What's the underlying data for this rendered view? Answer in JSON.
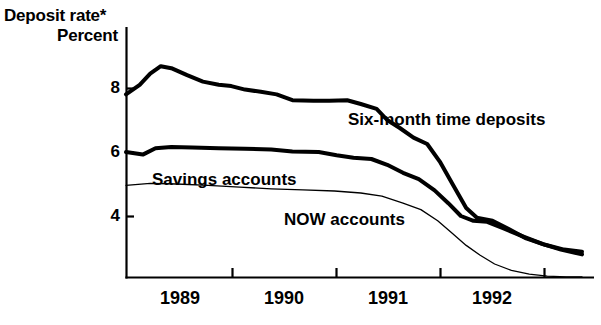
{
  "title": {
    "line1": "Deposit rate*",
    "line2": "Percent"
  },
  "axes": {
    "y_ticks": [
      "8",
      "6",
      "4"
    ],
    "x_ticks": [
      "1989",
      "1990",
      "1991",
      "1992"
    ]
  },
  "series_labels": {
    "six_month": "Six-month time deposits",
    "savings": "Savings accounts",
    "now": "NOW accounts"
  },
  "chart_data": {
    "type": "line",
    "title": "Deposit rate*",
    "subtitle": "Percent",
    "xlabel": "",
    "ylabel": "Percent",
    "xlim": [
      1988.62,
      1992.95
    ],
    "ylim": [
      2.06,
      9.9
    ],
    "yticks": [
      4,
      6,
      8
    ],
    "xticks": [
      1989,
      1990,
      1991,
      1992
    ],
    "grid": false,
    "legend": "inline-annotations",
    "annotations": [
      {
        "text": "Six-month time deposits",
        "x": 1991.0,
        "y": 6.85
      },
      {
        "text": "Savings accounts",
        "x": 1989.2,
        "y": 5.0
      },
      {
        "text": "NOW accounts",
        "x": 1990.3,
        "y": 3.8
      }
    ],
    "series": [
      {
        "name": "Six-month time deposits",
        "style": "thick",
        "x": [
          1988.62,
          1988.75,
          1988.85,
          1988.95,
          1989.05,
          1989.2,
          1989.35,
          1989.5,
          1989.62,
          1989.75,
          1989.9,
          1990.05,
          1990.2,
          1990.4,
          1990.55,
          1990.72,
          1990.85,
          1991.0,
          1991.1,
          1991.22,
          1991.35,
          1991.48,
          1991.6,
          1991.72,
          1991.85,
          1991.95,
          1992.1,
          1992.25,
          1992.42,
          1992.6,
          1992.78,
          1992.95
        ],
        "y": [
          7.8,
          8.1,
          8.45,
          8.68,
          8.62,
          8.4,
          8.2,
          8.1,
          8.06,
          7.95,
          7.88,
          7.8,
          7.62,
          7.6,
          7.6,
          7.62,
          7.5,
          7.35,
          7.0,
          6.75,
          6.45,
          6.25,
          5.7,
          5.0,
          4.25,
          3.95,
          3.85,
          3.6,
          3.3,
          3.1,
          2.95,
          2.88
        ]
      },
      {
        "name": "Savings accounts",
        "style": "thick",
        "x": [
          1988.62,
          1988.78,
          1988.9,
          1989.05,
          1989.25,
          1989.5,
          1989.75,
          1990.0,
          1990.2,
          1990.45,
          1990.62,
          1990.78,
          1990.95,
          1991.1,
          1991.25,
          1991.4,
          1991.55,
          1991.68,
          1991.8,
          1991.92,
          1992.05,
          1992.2,
          1992.4,
          1992.58,
          1992.75,
          1992.95
        ],
        "y": [
          6.0,
          5.92,
          6.12,
          6.16,
          6.14,
          6.12,
          6.1,
          6.08,
          6.02,
          6.0,
          5.9,
          5.82,
          5.78,
          5.6,
          5.35,
          5.15,
          4.8,
          4.4,
          4.0,
          3.85,
          3.82,
          3.62,
          3.35,
          3.12,
          2.95,
          2.8
        ]
      },
      {
        "name": "NOW accounts",
        "style": "thin",
        "x": [
          1988.62,
          1988.85,
          1989.1,
          1989.4,
          1989.7,
          1990.0,
          1990.3,
          1990.6,
          1990.85,
          1991.05,
          1991.25,
          1991.42,
          1991.58,
          1991.72,
          1991.85,
          1991.98,
          1992.12,
          1992.28,
          1992.45,
          1992.62,
          1992.8,
          1992.95
        ],
        "y": [
          4.96,
          5.02,
          5.0,
          4.96,
          4.9,
          4.85,
          4.82,
          4.78,
          4.72,
          4.62,
          4.4,
          4.2,
          3.85,
          3.45,
          3.08,
          2.78,
          2.5,
          2.3,
          2.18,
          2.12,
          2.1,
          2.1
        ]
      }
    ]
  }
}
